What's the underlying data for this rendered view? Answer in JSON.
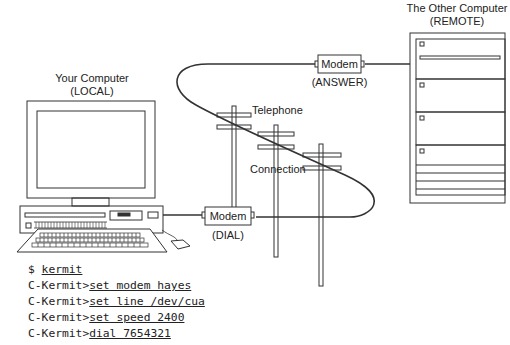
{
  "local_computer": {
    "title": "Your Computer",
    "subtitle": "(LOCAL)"
  },
  "remote_computer": {
    "title": "The Other Computer",
    "subtitle": "(REMOTE)"
  },
  "modem_local": {
    "label": "Modem",
    "mode": "(DIAL)"
  },
  "modem_remote": {
    "label": "Modem",
    "mode": "(ANSWER)"
  },
  "telephone_label": {
    "line1": "Telephone",
    "line2": "Connection"
  },
  "terminal": {
    "lines": [
      {
        "prompt": "$ ",
        "command": "kermit"
      },
      {
        "prompt": "C-Kermit>",
        "command": "set modem hayes"
      },
      {
        "prompt": "C-Kermit>",
        "command": "set line /dev/cua"
      },
      {
        "prompt": "C-Kermit>",
        "command": "set speed 2400"
      },
      {
        "prompt": "C-Kermit>",
        "command": "dial 7654321"
      }
    ]
  },
  "colors": {
    "stroke": "#333333",
    "background": "#ffffff"
  }
}
